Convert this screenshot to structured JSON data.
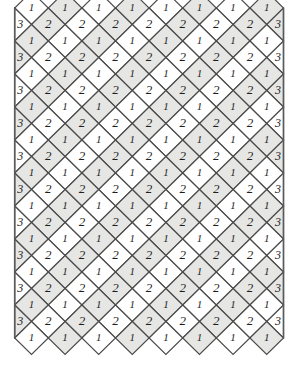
{
  "figure": {
    "type": "diagram",
    "width": 303,
    "height": 379,
    "background_color": "#ffffff"
  },
  "lattice": {
    "geometry": {
      "cell_width": 33.6,
      "cell_height": 33.0,
      "origin_x": 31.5,
      "origin_y": 8.0,
      "full_columns": 8,
      "one_rows": 11,
      "two_rows": 10,
      "half_cell_edges": [
        "left",
        "right"
      ]
    },
    "colors": {
      "tile_light": "#ffffff",
      "tile_shaded": "#e6e6e4",
      "stroke": "#4a4a4a",
      "edge_rail": "#5a5a5a",
      "label": "#1d1d1d"
    },
    "labels": {
      "apex": "1",
      "interior": "2",
      "edge": "3"
    },
    "label_sizes": {
      "apex": 11,
      "interior": 13,
      "edge": 12
    },
    "rows": [
      {
        "kind": "apex",
        "label": "1",
        "count": 8,
        "shade_start": 0
      },
      {
        "kind": "interior",
        "label": "2",
        "count": 8,
        "edge_label": "3",
        "shade_start": 1
      },
      {
        "kind": "apex",
        "label": "1",
        "count": 8,
        "shade_start": 1
      },
      {
        "kind": "interior",
        "label": "2",
        "count": 8,
        "edge_label": "3",
        "shade_start": 0
      },
      {
        "kind": "apex",
        "label": "1",
        "count": 8,
        "shade_start": 0
      },
      {
        "kind": "interior",
        "label": "2",
        "count": 8,
        "edge_label": "3",
        "shade_start": 1
      },
      {
        "kind": "apex",
        "label": "1",
        "count": 8,
        "shade_start": 1
      },
      {
        "kind": "interior",
        "label": "2",
        "count": 8,
        "edge_label": "3",
        "shade_start": 0
      },
      {
        "kind": "apex",
        "label": "1",
        "count": 8,
        "shade_start": 0
      },
      {
        "kind": "interior",
        "label": "2",
        "count": 8,
        "edge_label": "3",
        "shade_start": 1
      },
      {
        "kind": "apex",
        "label": "1",
        "count": 8,
        "shade_start": 1
      },
      {
        "kind": "interior",
        "label": "2",
        "count": 8,
        "edge_label": "3",
        "shade_start": 0
      },
      {
        "kind": "apex",
        "label": "1",
        "count": 8,
        "shade_start": 0
      },
      {
        "kind": "interior",
        "label": "2",
        "count": 8,
        "edge_label": "3",
        "shade_start": 1
      },
      {
        "kind": "apex",
        "label": "1",
        "count": 8,
        "shade_start": 1
      },
      {
        "kind": "interior",
        "label": "2",
        "count": 8,
        "edge_label": "3",
        "shade_start": 0
      },
      {
        "kind": "apex",
        "label": "1",
        "count": 8,
        "shade_start": 0
      },
      {
        "kind": "interior",
        "label": "2",
        "count": 8,
        "edge_label": "3",
        "shade_start": 1
      },
      {
        "kind": "apex",
        "label": "1",
        "count": 8,
        "shade_start": 1
      },
      {
        "kind": "interior",
        "label": "2",
        "count": 8,
        "edge_label": "3",
        "shade_start": 0
      },
      {
        "kind": "apex",
        "label": "1",
        "count": 8,
        "shade_start": 0
      }
    ]
  }
}
